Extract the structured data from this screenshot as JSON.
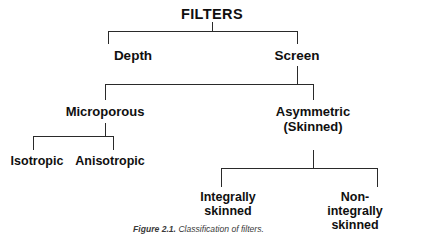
{
  "figure": {
    "caption_label": "Figure 2.1.",
    "caption_text": "Classification of filters.",
    "background_color": "#ffffff",
    "line_color": "#2a2a2a",
    "text_color": "#100f0f"
  },
  "tree": {
    "root": {
      "label": "FILTERS"
    },
    "level1": [
      {
        "label": "Depth"
      },
      {
        "label": "Screen"
      }
    ],
    "level2": [
      {
        "label": "Microporous"
      },
      {
        "label": "Asymmetric\n(Skinned)"
      }
    ],
    "level3_microporous": [
      {
        "label": "Isotropic"
      },
      {
        "label": "Anisotropic"
      }
    ],
    "level3_asymmetric": [
      {
        "label": "Integrally\nskinned"
      },
      {
        "label": "Non-integrally\nskinned"
      }
    ]
  }
}
